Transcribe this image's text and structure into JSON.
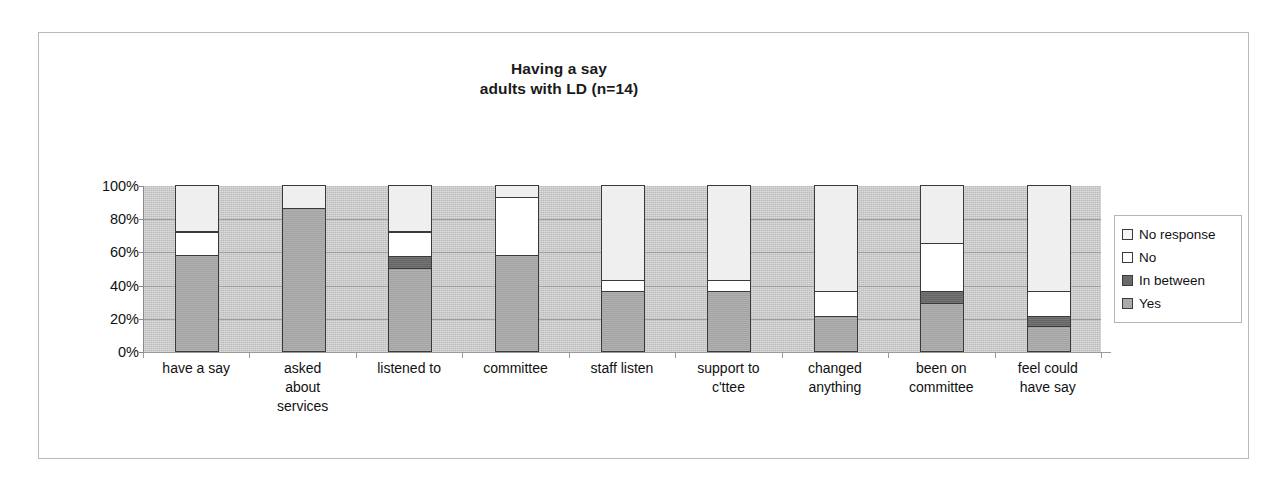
{
  "chart_data": {
    "type": "bar",
    "subtype": "stacked-100-percent",
    "title": "Having a say",
    "subtitle": "adults with LD (n=14)",
    "xlabel": "",
    "ylabel": "",
    "ylim": [
      0,
      100
    ],
    "ytick_labels": [
      "100%",
      "80%",
      "60%",
      "40%",
      "20%",
      "0%"
    ],
    "ytick_values": [
      100,
      80,
      60,
      40,
      20,
      0
    ],
    "grid": true,
    "legend_position": "right",
    "categories": [
      "have a say",
      "asked about services",
      "listened to",
      "committee",
      "staff listen",
      "support to c'ttee",
      "changed anything",
      "been on committee",
      "feel could have say"
    ],
    "category_lines": [
      [
        "have a say"
      ],
      [
        "asked",
        "about",
        "services"
      ],
      [
        "listened to"
      ],
      [
        "committee"
      ],
      [
        "staff listen"
      ],
      [
        "support to",
        "c'ttee"
      ],
      [
        "changed",
        "anything"
      ],
      [
        "been on",
        "committee"
      ],
      [
        "feel could",
        "have say"
      ]
    ],
    "series": [
      {
        "name": "Yes",
        "values": [
          58,
          86,
          50,
          58,
          36,
          36,
          21,
          29,
          15
        ]
      },
      {
        "name": "In between",
        "values": [
          0,
          0,
          7,
          0,
          0,
          0,
          0,
          7,
          6
        ]
      },
      {
        "name": "No",
        "values": [
          14,
          0,
          15,
          35,
          7,
          7,
          15,
          29,
          15
        ]
      },
      {
        "name": "No response",
        "values": [
          28,
          14,
          28,
          7,
          57,
          57,
          64,
          35,
          64
        ]
      }
    ],
    "legend_entries": [
      "No response",
      "No",
      "In between",
      "Yes"
    ],
    "colors": {
      "Yes": "#a8a8a8",
      "In between": "#6a6a6a",
      "No": "#ffffff",
      "No response": "#efefef",
      "plot_background": "#c9c9c9",
      "border": "#3a3a3a"
    }
  }
}
